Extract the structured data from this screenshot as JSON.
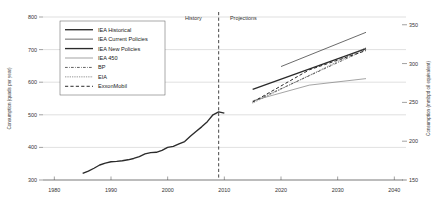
{
  "chart_data": {
    "type": "line",
    "title": "",
    "xlabel": "",
    "ylabel": "Consumption (quads per year)",
    "y2label": "Consumption (mmbpd oil equivalent)",
    "xlim": [
      1978,
      2041
    ],
    "ylim": [
      300,
      800
    ],
    "y2lim": [
      150,
      360
    ],
    "xticks": [
      1980,
      1990,
      2000,
      2010,
      2020,
      2030,
      2040
    ],
    "yticks": [
      300,
      400,
      500,
      600,
      700,
      800
    ],
    "y2ticks": [
      150,
      200,
      250,
      300,
      350
    ],
    "grid": "horizontal",
    "legend_position": "upper-left",
    "annotations": [
      {
        "text": "History",
        "x": 2006,
        "y": 790,
        "anchor": "end"
      },
      {
        "text": "Projections",
        "x": 2011,
        "y": 790,
        "anchor": "start"
      },
      {
        "text": "divider",
        "x": 2009,
        "style": "dashed-vertical"
      }
    ],
    "series": [
      {
        "name": "IEA Historical",
        "style": "solid",
        "width": 1.35,
        "color": "#2b2b2b",
        "points": [
          [
            1985,
            320
          ],
          [
            1986,
            327
          ],
          [
            1987,
            336
          ],
          [
            1988,
            346
          ],
          [
            1989,
            352
          ],
          [
            1990,
            356
          ],
          [
            1991,
            357
          ],
          [
            1992,
            359
          ],
          [
            1993,
            362
          ],
          [
            1994,
            366
          ],
          [
            1995,
            372
          ],
          [
            1996,
            380
          ],
          [
            1997,
            384
          ],
          [
            1998,
            385
          ],
          [
            1999,
            391
          ],
          [
            2000,
            400
          ],
          [
            2001,
            403
          ],
          [
            2002,
            411
          ],
          [
            2003,
            418
          ],
          [
            2004,
            434
          ],
          [
            2005,
            449
          ],
          [
            2006,
            463
          ],
          [
            2007,
            479
          ],
          [
            2008,
            500
          ],
          [
            2009,
            509
          ],
          [
            2010,
            505
          ]
        ]
      },
      {
        "name": "IEA Current Policies",
        "style": "solid",
        "width": 0.75,
        "color": "#3a3a3a",
        "points": [
          [
            2020,
            648
          ],
          [
            2035,
            753
          ]
        ]
      },
      {
        "name": "IEA New Policies",
        "style": "solid",
        "width": 1.35,
        "color": "#2b2b2b",
        "points": [
          [
            2015,
            578
          ],
          [
            2035,
            703
          ]
        ]
      },
      {
        "name": "IEA 450",
        "style": "solid",
        "width": 0.7,
        "color": "#7d7d7d",
        "points": [
          [
            2015,
            543
          ],
          [
            2025,
            591
          ],
          [
            2035,
            611
          ]
        ]
      },
      {
        "name": "BP",
        "style": "dashdot",
        "width": 0.8,
        "color": "#3a3a3a",
        "points": [
          [
            2015,
            540
          ],
          [
            2035,
            700
          ]
        ]
      },
      {
        "name": "EIA",
        "style": "dotted",
        "width": 0.8,
        "color": "#4a4a4a",
        "points": [
          [
            2015,
            536
          ],
          [
            2035,
            706
          ]
        ]
      },
      {
        "name": "ExxonMobil",
        "style": "dashed",
        "width": 1.0,
        "color": "#2b2b2b",
        "points": [
          [
            2015,
            539
          ],
          [
            2025,
            638
          ],
          [
            2035,
            697
          ]
        ]
      }
    ]
  },
  "legend": {
    "items": [
      {
        "label": "IEA Historical"
      },
      {
        "label": "IEA Current Policies"
      },
      {
        "label": "IEA New Policies"
      },
      {
        "label": "IEA 450"
      },
      {
        "label": "BP"
      },
      {
        "label": "EIA"
      },
      {
        "label": "ExxonMobil"
      }
    ]
  }
}
